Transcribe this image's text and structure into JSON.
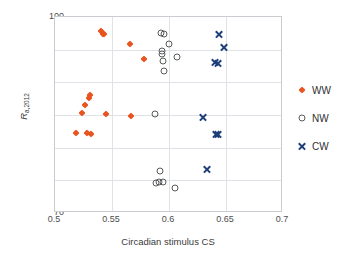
{
  "chart_data": {
    "type": "scatter",
    "title": "",
    "xlabel": "Circadian stimulus CS",
    "ylabel": "R a,2012",
    "ylabel_base": "R",
    "ylabel_sub": "a,2012",
    "xlim": [
      0.5,
      0.7
    ],
    "ylim": [
      70,
      100
    ],
    "xticks": [
      "0.5",
      "0.55",
      "0.6",
      "0.65",
      "0.7"
    ],
    "xtick_values": [
      0.5,
      0.55,
      0.6,
      0.65,
      0.7
    ],
    "yticks": [
      "70",
      "75",
      "80",
      "85",
      "90",
      "95",
      "100"
    ],
    "ytick_values": [
      70,
      75,
      80,
      85,
      90,
      95,
      100
    ],
    "grid": true,
    "legend_position": "right",
    "series": [
      {
        "name": "WW",
        "marker": "diamond",
        "color": "#e8531f",
        "points": [
          [
            0.518,
            82.3
          ],
          [
            0.524,
            85.3
          ],
          [
            0.526,
            86.5
          ],
          [
            0.528,
            82.3
          ],
          [
            0.53,
            87.6
          ],
          [
            0.531,
            88.0
          ],
          [
            0.532,
            82.1
          ],
          [
            0.54,
            97.8
          ],
          [
            0.542,
            97.4
          ],
          [
            0.543,
            97.4
          ],
          [
            0.545,
            85.2
          ],
          [
            0.566,
            95.9
          ],
          [
            0.567,
            84.8
          ],
          [
            0.578,
            93.5
          ]
        ]
      },
      {
        "name": "NW",
        "marker": "open-circle",
        "color": "#58595b",
        "points": [
          [
            0.588,
            85.1
          ],
          [
            0.589,
            74.6
          ],
          [
            0.591,
            74.7
          ],
          [
            0.592,
            76.5
          ],
          [
            0.593,
            97.5
          ],
          [
            0.594,
            94.8
          ],
          [
            0.594,
            94.3
          ],
          [
            0.595,
            93.2
          ],
          [
            0.595,
            74.8
          ],
          [
            0.596,
            97.4
          ],
          [
            0.596,
            91.7
          ],
          [
            0.6,
            95.8
          ],
          [
            0.605,
            73.9
          ],
          [
            0.607,
            93.9
          ]
        ]
      },
      {
        "name": "CW",
        "marker": "x",
        "color": "#1f3f7a",
        "points": [
          [
            0.63,
            84.7
          ],
          [
            0.633,
            76.6
          ],
          [
            0.64,
            93.0
          ],
          [
            0.641,
            82.1
          ],
          [
            0.643,
            92.9
          ],
          [
            0.643,
            82.0
          ],
          [
            0.644,
            97.3
          ],
          [
            0.648,
            95.4
          ]
        ]
      }
    ]
  },
  "legend": {
    "items": [
      {
        "label": "WW",
        "marker": "diamond",
        "color": "#e8531f"
      },
      {
        "label": "NW",
        "marker": "open-circle",
        "color": "#58595b"
      },
      {
        "label": "CW",
        "marker": "x",
        "color": "#1f3f7a"
      }
    ]
  }
}
